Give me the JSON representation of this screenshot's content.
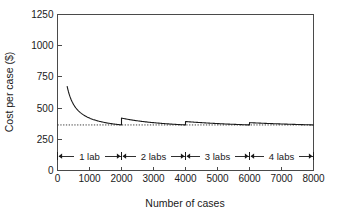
{
  "chart_data": {
    "type": "line",
    "title": "",
    "xlabel": "Number of cases",
    "ylabel": "Cost per case ($)",
    "xlim": [
      0,
      8000
    ],
    "ylim": [
      0,
      1250
    ],
    "xticks": [
      0,
      1000,
      2000,
      3000,
      4000,
      5000,
      6000,
      7000,
      8000
    ],
    "xticklabels": [
      "0",
      "1000",
      "2000",
      "3000",
      "4000",
      "5000",
      "6000",
      "7000",
      "8000"
    ],
    "yticks": [
      0,
      250,
      500,
      750,
      1000,
      1250
    ],
    "yticklabels": [
      "0",
      "250",
      "500",
      "750",
      "1000",
      "1250"
    ],
    "grid": false,
    "legend": null,
    "asymptote": {
      "value": 365,
      "style": "dotted",
      "label": ""
    },
    "series": [
      {
        "name": "Cost per case",
        "style": "solid",
        "color": "#1a1a1a",
        "description": "Sawtooth hyperbolic decay: cost = variable_cost + labs*fixed_cost/cases; capacity 2000 cases per lab",
        "variable_cost": 310,
        "fixed_cost_per_lab": 110000,
        "lab_capacity": 2000,
        "x_start": 300,
        "segments": [
          {
            "labs": 1,
            "label": "1 lab",
            "x_range": [
              300,
              2000
            ],
            "y_start": 1060,
            "y_end": 365
          },
          {
            "labs": 2,
            "label": "2 labs",
            "x_range": [
              2000,
              4000
            ],
            "y_start": 500,
            "y_end": 365
          },
          {
            "labs": 3,
            "label": "3 labs",
            "x_range": [
              4000,
              6000
            ],
            "y_start": 432,
            "y_end": 365
          },
          {
            "labs": 4,
            "label": "4 labs",
            "x_range": [
              6000,
              8000
            ],
            "y_start": 408,
            "y_end": 365
          }
        ],
        "points": [
          [
            300,
            1060
          ],
          [
            400,
            885
          ],
          [
            500,
            780
          ],
          [
            600,
            710
          ],
          [
            700,
            660
          ],
          [
            800,
            622
          ],
          [
            900,
            592
          ],
          [
            1000,
            568
          ],
          [
            1100,
            549
          ],
          [
            1200,
            532
          ],
          [
            1300,
            518
          ],
          [
            1400,
            506
          ],
          [
            1500,
            496
          ],
          [
            1600,
            487
          ],
          [
            1700,
            479
          ],
          [
            1800,
            472
          ],
          [
            1900,
            466
          ],
          [
            2000,
            365
          ],
          [
            2000,
            500
          ],
          [
            2200,
            480
          ],
          [
            2400,
            463
          ],
          [
            2600,
            449
          ],
          [
            2800,
            438
          ],
          [
            3000,
            428
          ],
          [
            3200,
            419
          ],
          [
            3400,
            412
          ],
          [
            3600,
            405
          ],
          [
            3800,
            400
          ],
          [
            4000,
            365
          ],
          [
            4000,
            432
          ],
          [
            4250,
            423
          ],
          [
            4500,
            416
          ],
          [
            4750,
            409
          ],
          [
            5000,
            403
          ],
          [
            5250,
            397
          ],
          [
            5500,
            392
          ],
          [
            5750,
            388
          ],
          [
            6000,
            365
          ],
          [
            6000,
            408
          ],
          [
            6250,
            403
          ],
          [
            6500,
            398
          ],
          [
            6750,
            394
          ],
          [
            7000,
            390
          ],
          [
            7250,
            386
          ],
          [
            7500,
            382
          ],
          [
            7750,
            379
          ],
          [
            8000,
            376
          ]
        ]
      }
    ],
    "annotations": [
      {
        "label": "1 lab",
        "x_from": 0,
        "x_to": 2000,
        "y": 115
      },
      {
        "label": "2 labs",
        "x_from": 2000,
        "x_to": 4000,
        "y": 115
      },
      {
        "label": "3 labs",
        "x_from": 4000,
        "x_to": 6000,
        "y": 115
      },
      {
        "label": "4 labs",
        "x_from": 6000,
        "x_to": 8000,
        "y": 115
      }
    ]
  },
  "colors": {
    "background": "#ffffff",
    "axis": "#4a4a4a",
    "curve": "#1a1a1a",
    "text": "#1a1a1a"
  }
}
